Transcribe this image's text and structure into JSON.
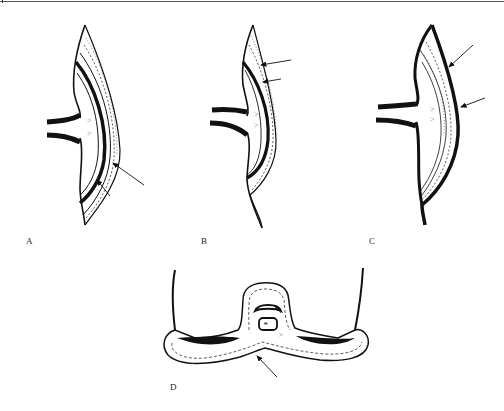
{
  "figure": {
    "panels": [
      {
        "id": "A",
        "label": "A",
        "description": "Curved wall section with two pipes; thick inner black layer; two arrows pointing to outer layers"
      },
      {
        "id": "B",
        "label": "B",
        "description": "Curved wall section with two pipes; thick black layer inside dotted layer; two arrows pointing from upper right"
      },
      {
        "id": "C",
        "label": "C",
        "description": "Curved wall section with thick black outer contour; striated/dotted inner layers; two arrows pointing to outer contour"
      },
      {
        "id": "D",
        "label": "D",
        "description": "Cross-section with central dome containing crescent and box marked with asterisk; thick black side regions; one arrow pointing to lower edge"
      }
    ],
    "symbols": {
      "asterisk": "*",
      "chevron": ">"
    },
    "colors": {
      "ink": "#111111",
      "background": "#ffffff",
      "gray_line": "#555555"
    }
  }
}
